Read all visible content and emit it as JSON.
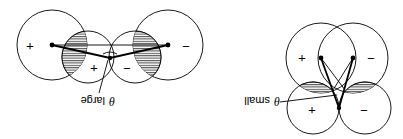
{
  "figure": {
    "rotation_degrees": 180,
    "colors": {
      "line": "#000000",
      "background": "#ffffff"
    },
    "panels": [
      {
        "id": "theta-large",
        "angle_label_symbol": "θ",
        "angle_label_text": "large",
        "signs": {
          "outer_left": "+",
          "inner_left": "+",
          "inner_right": "−",
          "outer_right": "−"
        }
      },
      {
        "id": "theta-small",
        "angle_label_symbol": "θ",
        "angle_label_text": "small",
        "signs": {
          "top_left": "+",
          "top_right": "−",
          "bottom_left": "+",
          "bottom_right": "−"
        }
      }
    ]
  }
}
